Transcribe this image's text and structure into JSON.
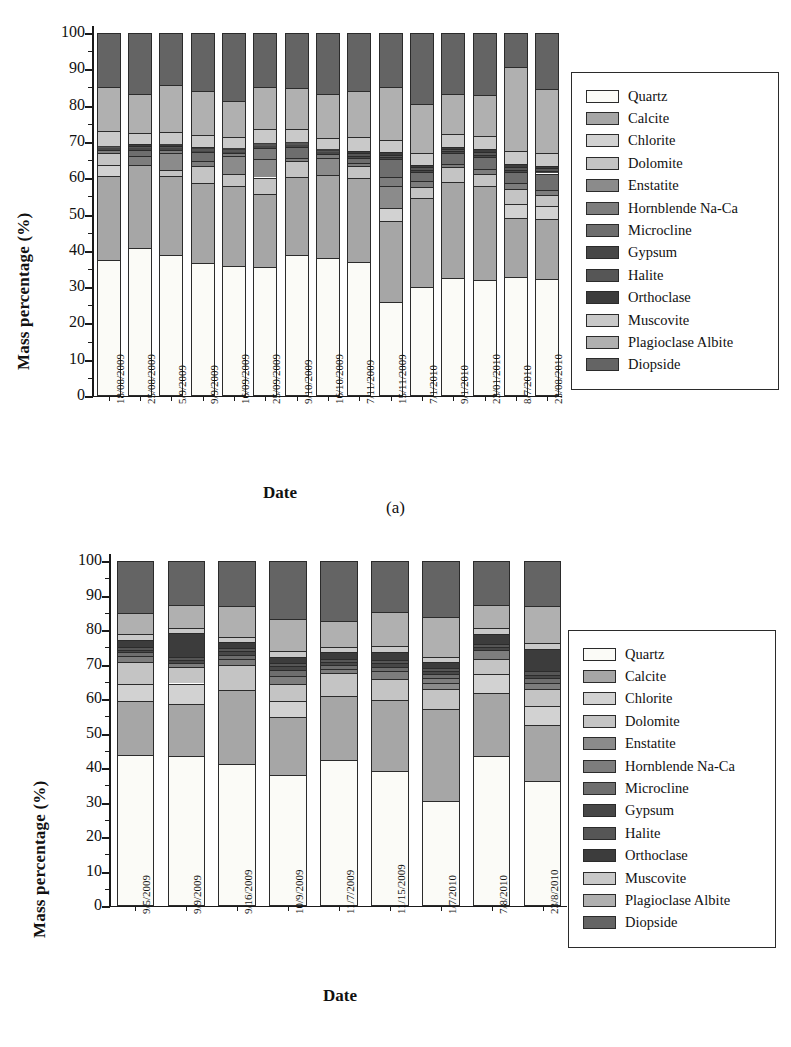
{
  "figure": {
    "subcaption_a": "(a)",
    "subcaption_b": "(b)"
  },
  "axis": {
    "ylabel": "Mass percentage (%)",
    "xlabel": "Date",
    "yticks": [
      "0",
      "10",
      "20",
      "30",
      "40",
      "50",
      "60",
      "70",
      "80",
      "90",
      "100"
    ]
  },
  "legend": {
    "entries": [
      {
        "label": "Quartz",
        "color": "#fbfbf7"
      },
      {
        "label": "Calcite",
        "color": "#a6a6a6"
      },
      {
        "label": "Chlorite",
        "color": "#d2d2d2"
      },
      {
        "label": "Dolomite",
        "color": "#c4c4c4"
      },
      {
        "label": "Enstatite",
        "color": "#8b8b8b"
      },
      {
        "label": "Hornblende Na-Ca",
        "color": "#7d7d7d"
      },
      {
        "label": "Microcline",
        "color": "#6e6e6e"
      },
      {
        "label": "Gypsum",
        "color": "#474747"
      },
      {
        "label": "Halite",
        "color": "#565656"
      },
      {
        "label": "Orthoclase",
        "color": "#3c3c3c"
      },
      {
        "label": "Muscovite",
        "color": "#c9c9c9"
      },
      {
        "label": "Plagioclase Albite",
        "color": "#b0b0b0"
      },
      {
        "label": "Diopside",
        "color": "#646464"
      }
    ]
  },
  "chart_data": [
    {
      "type": "bar",
      "subplot": "a",
      "stacked": true,
      "title": "",
      "xlabel": "Date",
      "ylabel": "Mass percentage (%)",
      "ylim": [
        0,
        100
      ],
      "ytick_step": 10,
      "yminor_step": 5,
      "grid": false,
      "legend_position": "right",
      "categories": [
        "18/08/2009",
        "25/08/2009",
        "5/9/2009",
        "9/9/2009",
        "16/09/2009",
        "25/09/2009",
        "9/10/2009",
        "16/10/2009",
        "7/11/2009",
        "15/11/2009",
        "7/1/2010",
        "9/1/2010",
        "23/01/2010",
        "8/7/2010",
        "23/08/2010"
      ],
      "series": [
        {
          "name": "Quartz",
          "values": [
            37.6,
            40.7,
            38.8,
            36.6,
            35.9,
            35.6,
            38.9,
            37.9,
            37.0,
            25.8,
            30.0,
            32.6,
            32.0,
            32.8,
            32.1
          ]
        },
        {
          "name": "Calcite",
          "values": [
            23.1,
            22.9,
            21.9,
            22.1,
            21.9,
            20.0,
            21.3,
            23.0,
            23.0,
            22.5,
            24.6,
            26.4,
            25.8,
            16.3,
            16.8
          ]
        },
        {
          "name": "Chlorite",
          "values": [
            2.9,
            0.0,
            0.0,
            0.0,
            0.0,
            0.0,
            0.0,
            0.0,
            0.0,
            3.5,
            0.0,
            0.0,
            0.0,
            3.7,
            3.4
          ]
        },
        {
          "name": "Dolomite",
          "values": [
            3.3,
            0.0,
            1.7,
            4.8,
            3.4,
            4.6,
            4.6,
            0.0,
            3.4,
            0.0,
            3.1,
            4.0,
            3.4,
            4.3,
            3.2
          ]
        },
        {
          "name": "Enstatite",
          "values": [
            0.0,
            0.0,
            4.5,
            0.0,
            4.8,
            5.2,
            0.0,
            4.7,
            0.0,
            6.1,
            0.0,
            0.0,
            0.0,
            0.0,
            0.0
          ]
        },
        {
          "name": "Hornblende Na-Ca",
          "values": [
            0.9,
            2.5,
            0.9,
            1.2,
            0.9,
            2.9,
            0.9,
            1.1,
            0.9,
            2.4,
            1.4,
            1.0,
            1.3,
            1.6,
            1.2
          ]
        },
        {
          "name": "Microcline",
          "values": [
            0.0,
            1.6,
            0.0,
            2.4,
            0.0,
            0.0,
            3.0,
            0.0,
            1.3,
            4.9,
            2.7,
            2.9,
            3.3,
            3.1,
            4.6
          ]
        },
        {
          "name": "Gypsum",
          "values": [
            0.4,
            0.5,
            0.5,
            0.5,
            0.4,
            0.5,
            0.4,
            0.4,
            0.6,
            0.7,
            0.6,
            0.6,
            0.7,
            0.6,
            0.7
          ]
        },
        {
          "name": "Halite",
          "values": [
            0.4,
            0.7,
            0.6,
            0.5,
            0.5,
            0.5,
            0.5,
            0.5,
            0.7,
            0.6,
            0.6,
            0.6,
            0.8,
            0.8,
            0.7
          ]
        },
        {
          "name": "Orthoclase",
          "values": [
            0.4,
            0.6,
            0.5,
            0.6,
            0.4,
            0.5,
            0.4,
            0.4,
            0.6,
            0.6,
            0.6,
            0.6,
            0.7,
            0.7,
            0.7
          ]
        },
        {
          "name": "Muscovite",
          "values": [
            4.0,
            3.0,
            3.4,
            3.1,
            3.2,
            3.7,
            3.6,
            3.1,
            3.8,
            3.3,
            3.3,
            3.5,
            3.5,
            3.6,
            3.5
          ]
        },
        {
          "name": "Plagioclase Albite",
          "values": [
            12.0,
            10.8,
            12.8,
            12.1,
            9.8,
            11.5,
            11.2,
            12.0,
            12.7,
            14.6,
            13.5,
            11.0,
            11.5,
            23.1,
            17.8
          ]
        },
        {
          "name": "Diopside",
          "values": [
            15.0,
            16.7,
            14.4,
            16.1,
            18.8,
            15.0,
            15.2,
            16.9,
            16.0,
            15.0,
            19.6,
            16.8,
            17.0,
            9.4,
            15.3
          ]
        }
      ]
    },
    {
      "type": "bar",
      "subplot": "b",
      "stacked": true,
      "title": "",
      "xlabel": "Date",
      "ylabel": "Mass percentage (%)",
      "ylim": [
        0,
        100
      ],
      "ytick_step": 10,
      "yminor_step": 5,
      "grid": false,
      "legend_position": "right",
      "categories": [
        "9/5/2009",
        "9/9/2009",
        "9/16/2009",
        "10/9/2009",
        "11/7/2009",
        "11/15/2009",
        "1/7/2010",
        "7/8/2010",
        "23/8/2010"
      ],
      "series": [
        {
          "name": "Quartz",
          "values": [
            43.8,
            43.4,
            41.3,
            38.1,
            42.2,
            39.0,
            30.4,
            43.6,
            36.1
          ]
        },
        {
          "name": "Calcite",
          "values": [
            15.6,
            15.3,
            21.3,
            16.8,
            18.6,
            20.6,
            26.6,
            18.2,
            16.4
          ]
        },
        {
          "name": "Chlorite",
          "values": [
            5.0,
            5.8,
            0.0,
            4.4,
            0.0,
            0.0,
            0.0,
            5.4,
            5.6
          ]
        },
        {
          "name": "Dolomite",
          "values": [
            6.2,
            4.9,
            7.2,
            5.0,
            6.8,
            6.1,
            5.8,
            4.4,
            4.7
          ]
        },
        {
          "name": "Enstatite",
          "values": [
            0.0,
            0.0,
            0.0,
            0.0,
            0.0,
            0.0,
            1.7,
            0.0,
            0.0
          ]
        },
        {
          "name": "Hornblende Na-Ca",
          "values": [
            1.8,
            1.1,
            1.9,
            2.5,
            1.2,
            2.3,
            1.5,
            2.5,
            1.8
          ]
        },
        {
          "name": "Microcline",
          "values": [
            1.2,
            0.0,
            1.2,
            1.7,
            1.2,
            1.4,
            1.3,
            0.0,
            1.4
          ]
        },
        {
          "name": "Gypsum",
          "values": [
            0.7,
            0.9,
            0.9,
            1.0,
            0.8,
            0.9,
            0.8,
            0.9,
            1.0
          ]
        },
        {
          "name": "Halite",
          "values": [
            0.8,
            0.9,
            0.9,
            0.9,
            0.9,
            1.0,
            0.9,
            1.0,
            1.1
          ]
        },
        {
          "name": "Orthoclase",
          "values": [
            2.0,
            6.8,
            1.9,
            1.9,
            2.0,
            2.4,
            1.6,
            2.9,
            6.4
          ]
        },
        {
          "name": "Muscovite",
          "values": [
            1.8,
            1.5,
            1.5,
            1.6,
            1.5,
            1.6,
            1.5,
            1.6,
            1.6
          ]
        },
        {
          "name": "Plagioclase Albite",
          "values": [
            6.1,
            6.6,
            8.8,
            9.2,
            7.3,
            9.8,
            11.6,
            6.7,
            11.0
          ]
        },
        {
          "name": "Diopside",
          "values": [
            15.0,
            12.8,
            13.1,
            16.9,
            17.5,
            14.9,
            16.3,
            12.8,
            12.9
          ]
        }
      ]
    }
  ]
}
